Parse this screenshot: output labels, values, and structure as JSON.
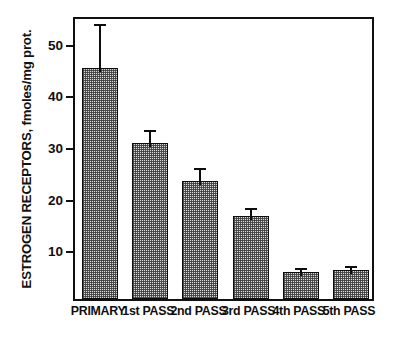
{
  "chart_data": {
    "type": "bar",
    "title": "",
    "xlabel": "",
    "ylabel": "ESTROGEN RECEPTORS, fmoles/mg prot.",
    "categories": [
      "PRIMARY",
      "1st PASS",
      "2nd PASS",
      "3rd PASS",
      "4th PASS",
      "5th PASS"
    ],
    "values": [
      44.8,
      30.2,
      22.8,
      16.0,
      5.2,
      5.6
    ],
    "errors": [
      9.2,
      3.3,
      3.4,
      2.4,
      1.5,
      1.5
    ],
    "ylim": [
      0,
      55
    ],
    "yticks": [
      10,
      20,
      30,
      40,
      50
    ],
    "ytick_labels": [
      "10",
      "20",
      "30",
      "40",
      "50"
    ],
    "grid": false,
    "legend": false,
    "error_bar_style": "upper-only-with-cap",
    "bar_fill": "stipple-hatch",
    "bar_edge_color": "#0d0d0d",
    "bar_face_color": "#d8d8d8",
    "axes_color": "#101010"
  },
  "figure": {
    "background": "#ffffff"
  }
}
